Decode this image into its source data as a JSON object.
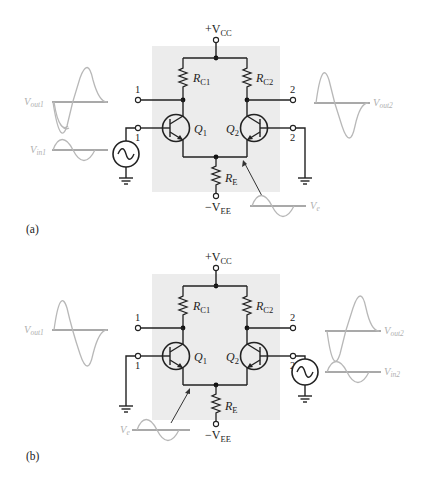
{
  "figure": {
    "panels": [
      {
        "id": "a",
        "label": "(a)",
        "input_side": "left",
        "supply_pos": "+V",
        "supply_pos_sub": "CC",
        "supply_neg": "−V",
        "supply_neg_sub": "EE",
        "rc1": "R",
        "rc1_sub": "C1",
        "rc2": "R",
        "rc2_sub": "C2",
        "re": "R",
        "re_sub": "E",
        "q1": "Q",
        "q1_sub": "1",
        "q2": "Q",
        "q2_sub": "2",
        "out1_terminal": "1",
        "out2_terminal": "2",
        "in1_terminal": "1",
        "in2_terminal": "2",
        "vout1": "V",
        "vout1_sub": "out1",
        "vout2": "V",
        "vout2_sub": "out2",
        "vin": "V",
        "vin_sub": "in1",
        "ve": "V",
        "ve_sub": "e"
      },
      {
        "id": "b",
        "label": "(b)",
        "input_side": "right",
        "supply_pos": "+V",
        "supply_pos_sub": "CC",
        "supply_neg": "−V",
        "supply_neg_sub": "EE",
        "rc1": "R",
        "rc1_sub": "C1",
        "rc2": "R",
        "rc2_sub": "C2",
        "re": "R",
        "re_sub": "E",
        "q1": "Q",
        "q1_sub": "1",
        "q2": "Q",
        "q2_sub": "2",
        "out1_terminal": "1",
        "out2_terminal": "2",
        "in1_terminal": "1",
        "in2_terminal": "2",
        "vout1": "V",
        "vout1_sub": "out1",
        "vout2": "V",
        "vout2_sub": "out2",
        "vin": "V",
        "vin_sub": "in2",
        "ve": "V",
        "ve_sub": "e"
      }
    ],
    "colors": {
      "highlight_box": "#ececec",
      "wire": "#222222",
      "waveform": "#b8b8b8",
      "waveform_label": "#b0b0b0"
    }
  }
}
